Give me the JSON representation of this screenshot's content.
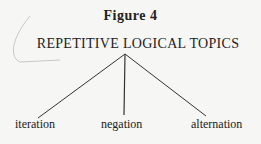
{
  "figure": {
    "title": "Figure 4",
    "root": "REPETITIVE LOGICAL TOPICS",
    "children": [
      "iteration",
      "negation",
      "alternation"
    ]
  }
}
